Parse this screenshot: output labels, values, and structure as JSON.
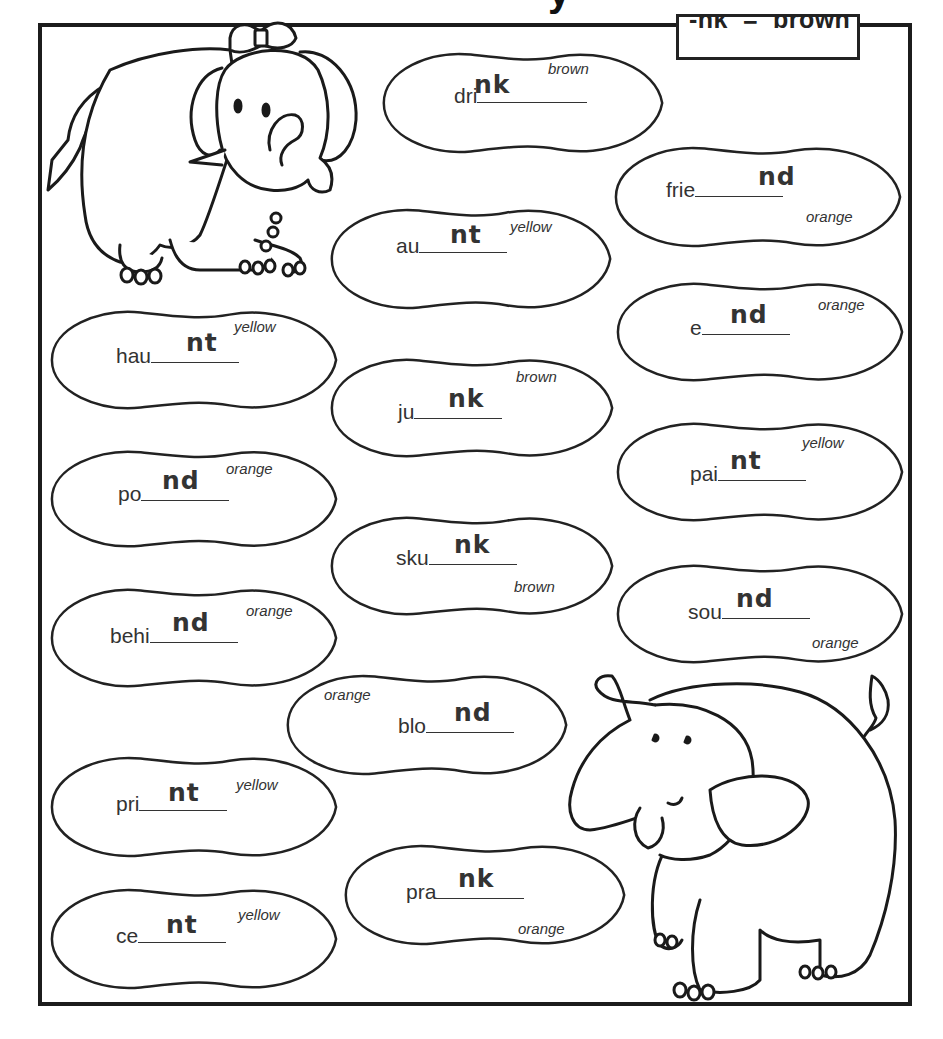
{
  "worksheet": {
    "title_fragment": "y",
    "legend": {
      "text": "-nk  =  brown"
    },
    "colors": {
      "outline": "#222222",
      "text": "#333333",
      "background": "#ffffff"
    },
    "blobs": [
      {
        "id": "drink",
        "prefix": "dri",
        "answer": "nk",
        "color": "brown",
        "x": 378,
        "y": 48,
        "w": 290,
        "h": 110,
        "lineW": 110,
        "tx": 76,
        "ty": 36,
        "cx": 170,
        "cy": 12,
        "ax": 96,
        "ay": 22
      },
      {
        "id": "friend",
        "prefix": "frie",
        "answer": "nd",
        "color": "orange",
        "x": 610,
        "y": 142,
        "w": 296,
        "h": 110,
        "lineW": 88,
        "tx": 56,
        "ty": 36,
        "cx": 196,
        "cy": 66,
        "ax": 148,
        "ay": 20
      },
      {
        "id": "aunt",
        "prefix": "au",
        "answer": "nt",
        "color": "yellow",
        "x": 326,
        "y": 204,
        "w": 290,
        "h": 110,
        "lineW": 88,
        "tx": 70,
        "ty": 30,
        "cx": 184,
        "cy": 14,
        "ax": 124,
        "ay": 16
      },
      {
        "id": "end",
        "prefix": "e",
        "answer": "nd",
        "color": "orange",
        "x": 612,
        "y": 278,
        "w": 296,
        "h": 108,
        "lineW": 88,
        "tx": 78,
        "ty": 38,
        "cx": 206,
        "cy": 18,
        "ax": 118,
        "ay": 22
      },
      {
        "id": "haunt",
        "prefix": "hau",
        "answer": "nt",
        "color": "yellow",
        "x": 46,
        "y": 306,
        "w": 296,
        "h": 108,
        "lineW": 88,
        "tx": 70,
        "ty": 38,
        "cx": 188,
        "cy": 12,
        "ax": 140,
        "ay": 22
      },
      {
        "id": "junk",
        "prefix": "ju",
        "answer": "nk",
        "color": "brown",
        "x": 326,
        "y": 354,
        "w": 292,
        "h": 108,
        "lineW": 88,
        "tx": 72,
        "ty": 46,
        "cx": 190,
        "cy": 14,
        "ax": 122,
        "ay": 30
      },
      {
        "id": "paint",
        "prefix": "pai",
        "answer": "nt",
        "color": "yellow",
        "x": 612,
        "y": 418,
        "w": 296,
        "h": 108,
        "lineW": 88,
        "tx": 78,
        "ty": 44,
        "cx": 190,
        "cy": 16,
        "ax": 118,
        "ay": 28
      },
      {
        "id": "pond",
        "prefix": "po",
        "answer": "nd",
        "color": "orange",
        "x": 46,
        "y": 446,
        "w": 296,
        "h": 106,
        "lineW": 88,
        "tx": 72,
        "ty": 36,
        "cx": 180,
        "cy": 14,
        "ax": 116,
        "ay": 20
      },
      {
        "id": "skunk",
        "prefix": "sku",
        "answer": "nk",
        "color": "brown",
        "x": 326,
        "y": 512,
        "w": 292,
        "h": 108,
        "lineW": 88,
        "tx": 70,
        "ty": 34,
        "cx": 188,
        "cy": 66,
        "ax": 128,
        "ay": 18
      },
      {
        "id": "sound",
        "prefix": "sou",
        "answer": "nd",
        "color": "orange",
        "x": 612,
        "y": 560,
        "w": 296,
        "h": 108,
        "lineW": 88,
        "tx": 76,
        "ty": 40,
        "cx": 200,
        "cy": 74,
        "ax": 124,
        "ay": 24
      },
      {
        "id": "behind",
        "prefix": "behi",
        "answer": "nd",
        "color": "orange",
        "x": 46,
        "y": 584,
        "w": 296,
        "h": 108,
        "lineW": 88,
        "tx": 64,
        "ty": 40,
        "cx": 200,
        "cy": 18,
        "ax": 126,
        "ay": 24
      },
      {
        "id": "blond",
        "prefix": "blo",
        "answer": "nd",
        "color": "orange",
        "x": 282,
        "y": 670,
        "w": 290,
        "h": 110,
        "lineW": 88,
        "tx": 116,
        "ty": 44,
        "cx": 42,
        "cy": 16,
        "ax": 172,
        "ay": 28
      },
      {
        "id": "print",
        "prefix": "pri",
        "answer": "nt",
        "color": "yellow",
        "x": 46,
        "y": 752,
        "w": 296,
        "h": 110,
        "lineW": 88,
        "tx": 70,
        "ty": 40,
        "cx": 190,
        "cy": 24,
        "ax": 122,
        "ay": 26
      },
      {
        "id": "prank",
        "prefix": "pra",
        "answer": "nk",
        "color": "orange",
        "x": 340,
        "y": 840,
        "w": 290,
        "h": 110,
        "lineW": 88,
        "tx": 66,
        "ty": 40,
        "cx": 178,
        "cy": 80,
        "ax": 118,
        "ay": 24
      },
      {
        "id": "cent",
        "prefix": "ce",
        "answer": "nt",
        "color": "yellow",
        "x": 46,
        "y": 884,
        "w": 296,
        "h": 110,
        "lineW": 88,
        "tx": 70,
        "ty": 40,
        "cx": 192,
        "cy": 22,
        "ax": 120,
        "ay": 26
      }
    ],
    "illustrations": [
      {
        "name": "elephant-with-bow",
        "position": "top-left"
      },
      {
        "name": "elephant-trunk-up",
        "position": "bottom-right"
      }
    ]
  }
}
